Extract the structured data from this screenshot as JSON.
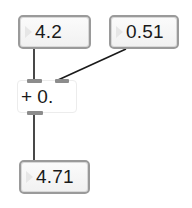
{
  "patch": {
    "objects": [
      {
        "id": "num1",
        "type": "flonum",
        "value": "4.2"
      },
      {
        "id": "num2",
        "type": "flonum",
        "value": "0.51"
      },
      {
        "id": "add",
        "type": "object",
        "text": "+ 0."
      },
      {
        "id": "num3",
        "type": "flonum",
        "value": "4.71"
      }
    ],
    "connections": [
      {
        "from": "num1",
        "outlet": 0,
        "to": "add",
        "inlet": 0
      },
      {
        "from": "num2",
        "outlet": 0,
        "to": "add",
        "inlet": 1
      },
      {
        "from": "add",
        "outlet": 0,
        "to": "num3",
        "inlet": 0
      }
    ]
  },
  "colors": {
    "background": "#ffffff",
    "box_border": "#9a9a9a",
    "cord": "#1a1a1a",
    "port": "#8c8c8c"
  }
}
